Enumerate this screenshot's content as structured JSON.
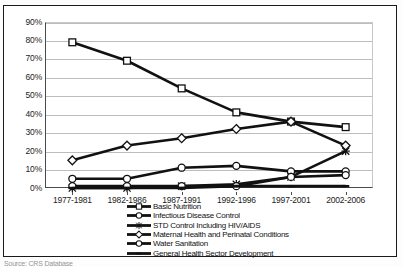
{
  "chart_data": {
    "type": "line",
    "title": "",
    "xlabel": "",
    "ylabel": "",
    "ylim": [
      0,
      90
    ],
    "ytick_labels": [
      "90%",
      "80%",
      "70%",
      "60%",
      "50%",
      "40%",
      "30%",
      "20%",
      "10%",
      "0%"
    ],
    "ytick_values": [
      90,
      80,
      70,
      60,
      50,
      40,
      30,
      20,
      10,
      0
    ],
    "grid": true,
    "legend_position": "bottom",
    "categories": [
      "1977-1981",
      "1982-1986",
      "1987-1991",
      "1992-1996",
      "1997-2001",
      "2002-2006"
    ],
    "series": [
      {
        "name": "Basic Nutrition",
        "marker": "square",
        "values": [
          79,
          69,
          54,
          41,
          36,
          33
        ]
      },
      {
        "name": "Infectious Disease Control",
        "marker": "circle",
        "values": [
          5,
          5,
          11,
          12,
          9,
          9
        ]
      },
      {
        "name": "STD Control Including HIV/AIDS",
        "marker": "cross",
        "values": [
          0,
          0,
          1,
          2,
          6,
          20
        ]
      },
      {
        "name": "Maternal Health and Perinatal Conditions",
        "marker": "diamond",
        "values": [
          15,
          23,
          27,
          32,
          36,
          23
        ]
      },
      {
        "name": "Water Sanitation",
        "marker": "circle",
        "values": [
          1,
          1,
          1,
          1,
          6,
          7
        ]
      },
      {
        "name": "General Health Sector Development",
        "marker": "dash",
        "values": [
          0,
          0,
          0,
          1,
          1,
          1
        ]
      }
    ]
  },
  "colors": {
    "series_line": "#111111",
    "gridline": "#bdbdbd",
    "axis": "#4a4a4a",
    "frame": "#1a1a1a",
    "text": "#1c1c1c",
    "background": "#ffffff"
  },
  "caption": {
    "source_text": "Source: CRS Database"
  }
}
